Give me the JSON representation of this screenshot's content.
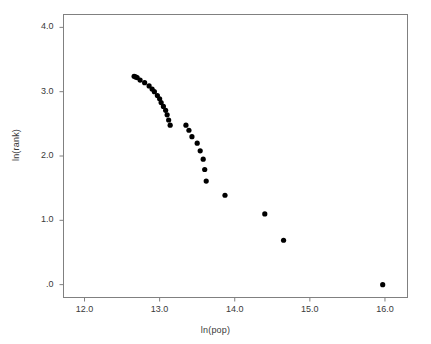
{
  "figure": {
    "kind": "scatter-plot",
    "background": "#ffffff",
    "frame_color": "#808080",
    "point_color": "#000000",
    "tick_color": "#808080",
    "text_color": "#3a3a3a"
  },
  "chart_data": {
    "type": "scatter",
    "title": "",
    "subtitle": "",
    "xlabel": "ln(pop)",
    "ylabel": "ln(rank)",
    "xlim": [
      11.72,
      16.3
    ],
    "ylim": [
      -0.2,
      4.2
    ],
    "xticks": [
      12.0,
      13.0,
      14.0,
      15.0,
      16.0
    ],
    "xtick_labels": [
      "12.0",
      "13.0",
      "14.0",
      "15.0",
      "16.0"
    ],
    "yticks": [
      0.0,
      1.0,
      2.0,
      3.0,
      4.0
    ],
    "ytick_labels": [
      ".0",
      "1.0",
      "2.0",
      "3.0",
      "4.0"
    ],
    "grid": false,
    "legend": null,
    "marker": "filled-circle",
    "marker_size_px": 5.2,
    "series": [
      {
        "name": "cities",
        "x": [
          15.97,
          14.65,
          14.4,
          13.87,
          13.62,
          13.6,
          13.58,
          13.54,
          13.5,
          13.43,
          13.39,
          13.35,
          13.14,
          13.12,
          13.1,
          13.08,
          13.05,
          13.02,
          13.0,
          12.97,
          12.93,
          12.9,
          12.86,
          12.8,
          12.74,
          12.7,
          12.68,
          12.66
        ],
        "y": [
          0.0,
          0.69,
          1.1,
          1.39,
          1.61,
          1.79,
          1.95,
          2.08,
          2.2,
          2.3,
          2.4,
          2.48,
          2.48,
          2.56,
          2.64,
          2.71,
          2.77,
          2.83,
          2.89,
          2.94,
          3.0,
          3.04,
          3.09,
          3.14,
          3.18,
          3.22,
          3.23,
          3.24
        ]
      }
    ]
  },
  "axes": {
    "x_axis_name": "x-axis",
    "y_axis_name": "y-axis"
  }
}
